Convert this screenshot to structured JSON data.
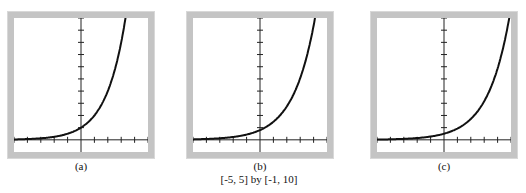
{
  "chart_data": [
    {
      "type": "line",
      "title": "(a)",
      "window": "[-5, 5] by [-1, 10]",
      "xlim": [
        -5,
        5
      ],
      "ylim": [
        -1,
        10
      ],
      "xticks": [
        -5,
        -4,
        -3,
        -2,
        -1,
        0,
        1,
        2,
        3,
        4,
        5
      ],
      "yticks": [
        1,
        2,
        3,
        4,
        5,
        6,
        7,
        8,
        9,
        10
      ],
      "grid": false,
      "series": [
        {
          "name": "curve-a",
          "function": "y = 2^x",
          "x": [
            -5,
            -4,
            -3,
            -2,
            -1,
            0,
            1,
            2,
            3,
            3.32
          ],
          "y": [
            0.03,
            0.06,
            0.13,
            0.25,
            0.5,
            1,
            2,
            4,
            8,
            10
          ]
        }
      ]
    },
    {
      "type": "line",
      "title": "(b)",
      "window": "[-5, 5] by [-1, 10]",
      "xlim": [
        -5,
        5
      ],
      "ylim": [
        -1,
        10
      ],
      "xticks": [
        -5,
        -4,
        -3,
        -2,
        -1,
        0,
        1,
        2,
        3,
        4,
        5
      ],
      "yticks": [
        1,
        2,
        3,
        4,
        5,
        6,
        7,
        8,
        9,
        10
      ],
      "grid": false,
      "series": [
        {
          "name": "curve-b",
          "function": "y = 0.8·1.85^x",
          "x": [
            -5,
            -4,
            -3,
            -2,
            -1,
            0,
            1,
            2,
            3,
            4,
            4.1
          ],
          "y": [
            0.04,
            0.07,
            0.13,
            0.23,
            0.43,
            0.8,
            1.48,
            2.74,
            5.07,
            9.37,
            10
          ]
        }
      ]
    },
    {
      "type": "line",
      "title": "(c)",
      "window": "[-5, 5] by [-1, 10]",
      "xlim": [
        -5,
        5
      ],
      "ylim": [
        -1,
        10
      ],
      "xticks": [
        -5,
        -4,
        -3,
        -2,
        -1,
        0,
        1,
        2,
        3,
        4,
        5
      ],
      "yticks": [
        1,
        2,
        3,
        4,
        5,
        6,
        7,
        8,
        9,
        10
      ],
      "grid": false,
      "series": [
        {
          "name": "curve-c",
          "function": "y = 0.5·1.85^x",
          "x": [
            -5,
            -4,
            -3,
            -2,
            -1,
            0,
            1,
            2,
            3,
            4,
            4.87
          ],
          "y": [
            0.02,
            0.04,
            0.08,
            0.15,
            0.27,
            0.5,
            0.93,
            1.71,
            3.17,
            5.86,
            10
          ]
        }
      ]
    }
  ],
  "captions": {
    "a": "(a)",
    "b": "(b)",
    "c": "(c)"
  },
  "window_label": "[-5, 5] by [-1, 10]"
}
